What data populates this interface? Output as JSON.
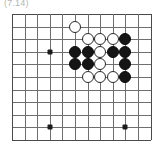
{
  "figure": {
    "caption": "(7.14)",
    "type": "go-board-diagram"
  },
  "board": {
    "columns": 12,
    "rows": 11,
    "grid_spacing_px": 12.6,
    "origin_x_px": 5,
    "origin_y_px": 5,
    "line_color": "#6f6f6f",
    "edge_color": "#4a4a4a",
    "background": "#ffffff",
    "star_point_color": "#1b1b1b",
    "star_points": [
      {
        "col": 3,
        "row": 3,
        "name": "star-point-upper-left"
      },
      {
        "col": 3,
        "row": 9,
        "name": "star-point-lower-left"
      },
      {
        "col": 9,
        "row": 9,
        "name": "star-point-lower-right"
      }
    ],
    "stone_colors": {
      "black": "#151515",
      "white": "#ffffff",
      "white_outline": "#2a2a2a"
    },
    "stone_diameter_px": 12,
    "stones": [
      {
        "col": 5,
        "row": 1,
        "color": "white",
        "label": "white-stone-e1"
      },
      {
        "col": 6,
        "row": 2,
        "color": "white",
        "label": "white-stone-f2"
      },
      {
        "col": 7,
        "row": 2,
        "color": "white",
        "label": "white-stone-g2"
      },
      {
        "col": 8,
        "row": 2,
        "color": "white",
        "label": "white-stone-h2"
      },
      {
        "col": 9,
        "row": 2,
        "color": "black",
        "label": "black-stone-i2"
      },
      {
        "col": 5,
        "row": 3,
        "color": "black",
        "label": "black-stone-e3"
      },
      {
        "col": 6,
        "row": 3,
        "color": "black",
        "label": "black-stone-f3"
      },
      {
        "col": 7,
        "row": 3,
        "color": "white",
        "label": "white-stone-g3"
      },
      {
        "col": 8,
        "row": 3,
        "color": "black",
        "label": "black-stone-h3"
      },
      {
        "col": 9,
        "row": 3,
        "color": "black",
        "label": "black-stone-i3"
      },
      {
        "col": 5,
        "row": 4,
        "color": "black",
        "label": "black-stone-e4"
      },
      {
        "col": 6,
        "row": 4,
        "color": "black",
        "label": "black-stone-f4"
      },
      {
        "col": 7,
        "row": 4,
        "color": "white",
        "label": "white-stone-g4"
      },
      {
        "col": 9,
        "row": 4,
        "color": "black",
        "label": "black-stone-i4"
      },
      {
        "col": 6,
        "row": 5,
        "color": "white",
        "label": "white-stone-f5"
      },
      {
        "col": 7,
        "row": 5,
        "color": "white",
        "label": "white-stone-g5"
      },
      {
        "col": 8,
        "row": 5,
        "color": "white",
        "label": "white-stone-h5"
      },
      {
        "col": 9,
        "row": 5,
        "color": "black",
        "label": "black-stone-i5"
      }
    ]
  }
}
